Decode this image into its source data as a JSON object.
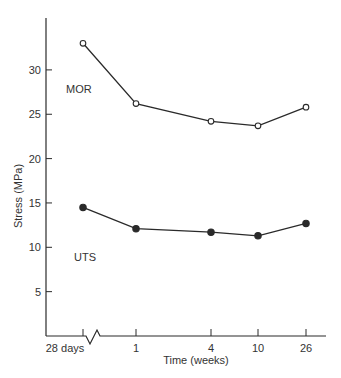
{
  "chart_data": {
    "type": "line",
    "title": "",
    "xlabel": "Time (weeks)",
    "ylabel": "Stress (MPa)",
    "categories": [
      "28 days",
      "1",
      "4",
      "10",
      "26"
    ],
    "x_break_after": "28 days",
    "ylim": [
      0,
      35
    ],
    "yticks": [
      5,
      10,
      15,
      20,
      25,
      30
    ],
    "grid": false,
    "legend": "inline labels",
    "series": [
      {
        "name": "MOR",
        "marker": "open-circle",
        "values": [
          33.0,
          26.2,
          24.2,
          23.7,
          25.8
        ]
      },
      {
        "name": "UTS",
        "marker": "filled-circle",
        "values": [
          14.5,
          12.1,
          11.7,
          11.3,
          12.7
        ]
      }
    ]
  },
  "colors": {
    "line": "#2a2a2a",
    "background": "#ffffff"
  }
}
